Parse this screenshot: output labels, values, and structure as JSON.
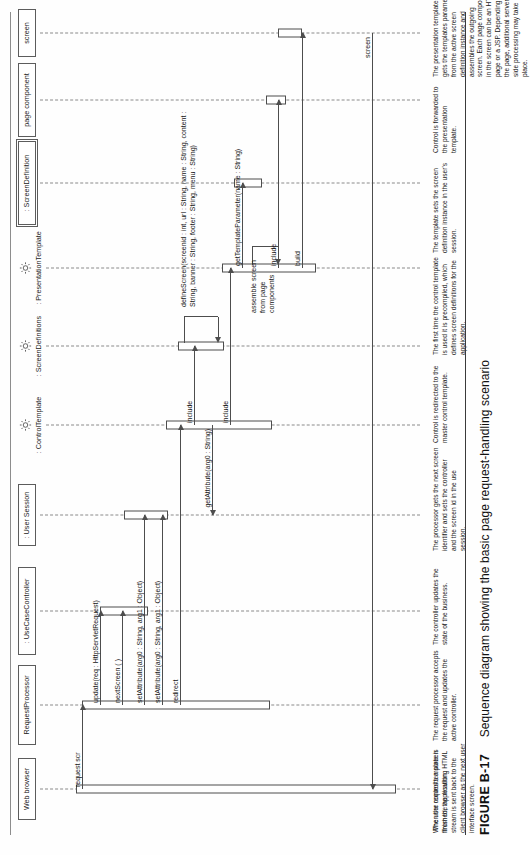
{
  "figure": {
    "number": "FIGURE B-17",
    "title": "Sequence diagram showing the basic page request-handling scenario"
  },
  "diagram": {
    "type": "uml-sequence-diagram",
    "lifelines": [
      {
        "id": "webbrowser",
        "label": "Web browser",
        "kind": "object-box"
      },
      {
        "id": "reqproc",
        "label": "RequestProcessor",
        "kind": "object-box"
      },
      {
        "id": "usecase",
        "label": ": UseCaseController",
        "kind": "object-box"
      },
      {
        "id": "session",
        "label": ": User Session",
        "kind": "object-box"
      },
      {
        "id": "ctrltmpl",
        "label": ": ControlTemplate",
        "kind": "gear"
      },
      {
        "id": "screendefs",
        "label": ": ScreenDefinitions",
        "kind": "gear"
      },
      {
        "id": "prestmpl",
        "label": ": PresentationTemplate",
        "kind": "gear"
      },
      {
        "id": "screendef",
        "label": ": ScreenDefinition",
        "kind": "object-box-double"
      },
      {
        "id": "pagecomp",
        "label": "page component",
        "kind": "object-box"
      },
      {
        "id": "screen",
        "label": "screen",
        "kind": "object-box"
      }
    ],
    "messages": [
      {
        "id": "m1",
        "label": "request scr",
        "from": "webbrowser",
        "to": "reqproc",
        "direction": "right"
      },
      {
        "id": "m2",
        "label": "update(req : HttpServletRequest)",
        "from": "reqproc",
        "to": "usecase",
        "direction": "right"
      },
      {
        "id": "m3",
        "label": "nextScreen ( )",
        "from": "reqproc",
        "to": "usecase",
        "direction": "right"
      },
      {
        "id": "m4",
        "label": "setAttribute(arg0 : String, arg1 : Object)",
        "from": "reqproc",
        "to": "session",
        "direction": "right"
      },
      {
        "id": "m5",
        "label": "setAttribute(arg0 : String, arg1 : Object)",
        "from": "reqproc",
        "to": "session",
        "direction": "right"
      },
      {
        "id": "m6",
        "label": "redirect",
        "from": "reqproc",
        "to": "ctrltmpl",
        "direction": "right"
      },
      {
        "id": "m7",
        "label": "include",
        "from": "ctrltmpl",
        "to": "screendefs",
        "direction": "right"
      },
      {
        "id": "m8",
        "label": "defineScreen(screenid : int, url : String, name : String, content : String, banner : String, footer : String, menu : String)",
        "from": "screendefs",
        "to": "screendefs",
        "direction": "self"
      },
      {
        "id": "m9",
        "label": "getAttribute(arg0 : String)",
        "from": "ctrltmpl",
        "to": "session",
        "direction": "left"
      },
      {
        "id": "m10",
        "label": "include",
        "from": "ctrltmpl",
        "to": "prestmpl",
        "direction": "right"
      },
      {
        "id": "m11",
        "label": "getTemplateParameter(name : String)",
        "from": "prestmpl",
        "to": "screendef",
        "direction": "right"
      },
      {
        "id": "m12",
        "label": "assemble screen from page components",
        "from": "prestmpl",
        "to": "prestmpl",
        "direction": "self"
      },
      {
        "id": "m13",
        "label": "include",
        "from": "prestmpl",
        "to": "pagecomp",
        "direction": "right"
      },
      {
        "id": "m14",
        "label": "build",
        "from": "prestmpl",
        "to": "screen",
        "direction": "right"
      },
      {
        "id": "m15",
        "label": "screen",
        "from": "screen",
        "to": "webbrowser",
        "direction": "left"
      }
    ],
    "annotations": [
      {
        "id": "n1",
        "text": "The user requests a screen from the application."
      },
      {
        "id": "n2",
        "text": "The request processor accepts the request and updates the active controller."
      },
      {
        "id": "n3",
        "text": "The controller updates the state of the business."
      },
      {
        "id": "n4",
        "text": "The processor gets the next screen identifier and sets the controller and the screen id in the use session."
      },
      {
        "id": "n5",
        "text": "Control is redirected to the master control template."
      },
      {
        "id": "n6",
        "text": "The first time the control template is used  it is precompiled, which defines screen definitions for the application."
      },
      {
        "id": "n7",
        "text": "The template sets the screen definition instance in the user's session."
      },
      {
        "id": "n8",
        "text": "Control is forwarded to the presentation template."
      },
      {
        "id": "n9",
        "text": "The presentation template gets the templates parameters from the active screen definition instance and assembles the outgoing screen.  Each page component in the screen can be an HTML page or a JSP.  Depending on the page, additional server-side processing may take place."
      },
      {
        "id": "n10",
        "text": "When the control template is finished, the resulting HTML stream is sent back to the client browser as the next user interface screen."
      }
    ]
  }
}
